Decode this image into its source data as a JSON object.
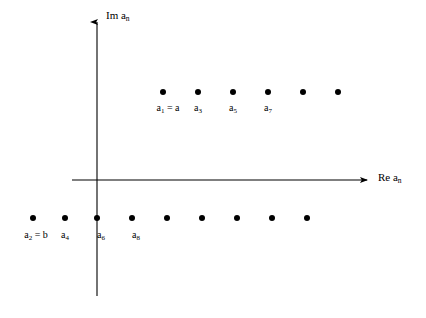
{
  "figure": {
    "background_color": "#ffffff",
    "ink_color": "#000000",
    "axes": {
      "y_axis_label": "Im a",
      "y_axis_label_sub": "n",
      "x_axis_label": "Re a",
      "x_axis_label_sub": "n",
      "origin_x": 97,
      "origin_y": 180,
      "x_axis_left": 72,
      "x_axis_right": 371,
      "y_axis_top": 18,
      "y_axis_bottom": 296
    }
  },
  "chart_data": {
    "type": "scatter",
    "title": "",
    "xlabel": "Re a_n",
    "ylabel": "Im a_n",
    "grid": false,
    "legend": "none",
    "axis_origin_px": [
      97,
      180
    ],
    "xlim_px": [
      72,
      371
    ],
    "ylim_px": [
      18,
      296
    ],
    "series": [
      {
        "name": "upper-row",
        "description": "Odd-index terms a_1, a_3, a_5, ... located above the real axis",
        "points_px": [
          {
            "x": 163,
            "y": 92
          },
          {
            "x": 198,
            "y": 92
          },
          {
            "x": 233,
            "y": 92
          },
          {
            "x": 268,
            "y": 92
          },
          {
            "x": 303,
            "y": 92
          },
          {
            "x": 338,
            "y": 92
          }
        ],
        "labels": [
          {
            "index": 0,
            "text": "a",
            "sub": "1",
            "suffix": " = a",
            "x": 168,
            "y": 103
          },
          {
            "index": 1,
            "text": "a",
            "sub": "3",
            "suffix": "",
            "x": 198,
            "y": 103
          },
          {
            "index": 2,
            "text": "a",
            "sub": "5",
            "suffix": "",
            "x": 233,
            "y": 103
          },
          {
            "index": 3,
            "text": "a",
            "sub": "7",
            "suffix": "",
            "x": 268,
            "y": 103
          }
        ]
      },
      {
        "name": "lower-row",
        "description": "Even-index terms a_2, a_4, a_6, ... located below the real axis",
        "points_px": [
          {
            "x": 33,
            "y": 218
          },
          {
            "x": 65,
            "y": 218
          },
          {
            "x": 97,
            "y": 218
          },
          {
            "x": 132,
            "y": 218
          },
          {
            "x": 167,
            "y": 218
          },
          {
            "x": 202,
            "y": 218
          },
          {
            "x": 237,
            "y": 218
          },
          {
            "x": 272,
            "y": 218
          },
          {
            "x": 307,
            "y": 218
          }
        ],
        "labels": [
          {
            "index": 0,
            "text": "a",
            "sub": "2",
            "suffix": " = b",
            "x": 36,
            "y": 230
          },
          {
            "index": 1,
            "text": "a",
            "sub": "4",
            "suffix": "",
            "x": 65,
            "y": 230
          },
          {
            "index": 2,
            "text": "a",
            "sub": "6",
            "suffix": "",
            "x": 101,
            "y": 230
          },
          {
            "index": 3,
            "text": "a",
            "sub": "8",
            "suffix": "",
            "x": 136,
            "y": 230
          }
        ]
      }
    ],
    "point_radius_px": 3,
    "point_color": "#000000"
  },
  "labels": {
    "y_axis": {
      "base": "Im a",
      "sub": "n"
    },
    "x_axis": {
      "base": "Re a",
      "sub": "n"
    },
    "a1": {
      "base": "a",
      "sub": "1",
      "suffix": " = a"
    },
    "a3": {
      "base": "a",
      "sub": "3",
      "suffix": ""
    },
    "a5": {
      "base": "a",
      "sub": "5",
      "suffix": ""
    },
    "a7": {
      "base": "a",
      "sub": "7",
      "suffix": ""
    },
    "a2": {
      "base": "a",
      "sub": "2",
      "suffix": " = b"
    },
    "a4": {
      "base": "a",
      "sub": "4",
      "suffix": ""
    },
    "a6": {
      "base": "a",
      "sub": "6",
      "suffix": ""
    },
    "a8": {
      "base": "a",
      "sub": "8",
      "suffix": ""
    }
  }
}
